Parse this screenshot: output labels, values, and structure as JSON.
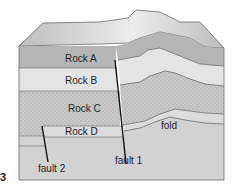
{
  "diagram": {
    "figure_number": "3",
    "layers": [
      {
        "name": "Rock A",
        "label": "Rock A",
        "fill": "#b5b5b5"
      },
      {
        "name": "Rock B",
        "label": "Rock B",
        "fill": "#e4e4e4"
      },
      {
        "name": "Rock C",
        "label": "Rock C",
        "fill": "#c4c4c4",
        "pattern": "stippled"
      },
      {
        "name": "Rock D",
        "label": "Rock D",
        "fill": "#dcdcdc"
      },
      {
        "name": "Base layer",
        "label": "",
        "fill": "#d2d2d2"
      }
    ],
    "annotations": {
      "fault1": "fault 1",
      "fault2": "fault 2",
      "fold": "fold"
    },
    "colors": {
      "top_surface": "#c8c8c8",
      "top_highlight": "#ececec",
      "outline": "#6a6a6a",
      "fault_line": "#111111"
    }
  }
}
